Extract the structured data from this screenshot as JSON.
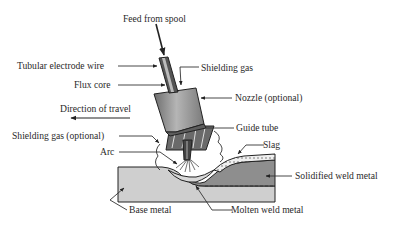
{
  "labels": {
    "feed": "Feed from spool",
    "tubular_wire": "Tubular electrode wire",
    "shielding_gas": "Shielding gas",
    "flux_core": "Flux core",
    "nozzle": "Nozzle (optional)",
    "direction": "Direction of travel",
    "guide_tube": "Guide tube",
    "shielding_gas_optional": "Shielding gas (optional)",
    "slag": "Slag",
    "arc": "Arc",
    "solidified": "Solidified weld metal",
    "base_metal": "Base metal",
    "molten": "Molten weld metal"
  },
  "colors": {
    "line": "#222222",
    "text": "#2a2a2a",
    "nozzle_fill": "#9a9a9a",
    "base_fill": "#cfcfcf",
    "weld_fill": "#8e8e8e",
    "slag_fill": "#e6e6e6"
  }
}
